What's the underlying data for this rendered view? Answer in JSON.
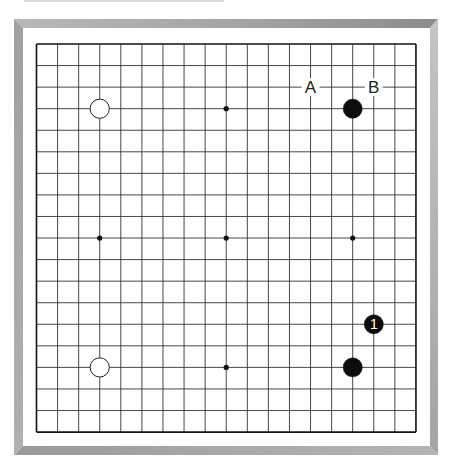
{
  "board": {
    "size": 19,
    "origin_x": 36.5,
    "origin_y": 44,
    "spacing_x": 21.08,
    "spacing_y": 21.56,
    "line_color": "#333333",
    "border_color": "#111111",
    "hoshi": [
      [
        3,
        3
      ],
      [
        9,
        3
      ],
      [
        15,
        3
      ],
      [
        3,
        9
      ],
      [
        9,
        9
      ],
      [
        15,
        9
      ],
      [
        3,
        15
      ],
      [
        9,
        15
      ],
      [
        15,
        15
      ]
    ],
    "visible_hoshi": [
      [
        9,
        3
      ],
      [
        3,
        9
      ],
      [
        9,
        9
      ],
      [
        15,
        9
      ],
      [
        9,
        15
      ]
    ]
  },
  "stones": [
    {
      "color": "white",
      "col": 3,
      "row": 3,
      "label": ""
    },
    {
      "color": "black",
      "col": 15,
      "row": 3,
      "label": ""
    },
    {
      "color": "white",
      "col": 3,
      "row": 15,
      "label": ""
    },
    {
      "color": "black",
      "col": 15,
      "row": 15,
      "label": ""
    },
    {
      "color": "black",
      "col": 16,
      "row": 13,
      "label": "1"
    }
  ],
  "markers": [
    {
      "col": 13,
      "row": 2,
      "label": "A"
    },
    {
      "col": 16,
      "row": 2,
      "label": "B"
    }
  ],
  "colors": {
    "black_stone": "#0d0d0d",
    "white_stone": "#ffffff",
    "stone_outline": "#222222",
    "frame_gray": "#a8a8a8"
  }
}
